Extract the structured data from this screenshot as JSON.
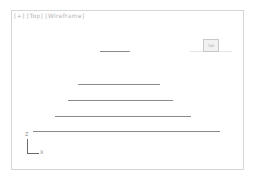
{
  "viewport": {
    "label_parts": [
      "[+]",
      "[Top]",
      "[Wireframe]"
    ],
    "viewcube_face": "TOP",
    "axis_tripod": {
      "vertical_label": "Z",
      "horizontal_label": "X"
    },
    "colors": {
      "border": "#d6d6d6",
      "line": "#8a8a8a",
      "label": "#b4b4b4",
      "background": "#ffffff"
    },
    "shapes": [
      {
        "name": "line-1",
        "x1": 100,
        "x2": 130,
        "y": 51
      },
      {
        "name": "line-2",
        "x1": 78,
        "x2": 160,
        "y": 84
      },
      {
        "name": "line-3",
        "x1": 68,
        "x2": 173,
        "y": 100
      },
      {
        "name": "line-4",
        "x1": 55,
        "x2": 191,
        "y": 116
      },
      {
        "name": "line-5",
        "x1": 33,
        "x2": 220,
        "y": 131
      }
    ]
  }
}
